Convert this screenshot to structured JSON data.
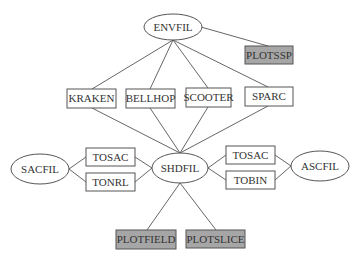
{
  "diagram": {
    "title": "",
    "colors": {
      "edge": "#555555",
      "box_fill": "#ffffff",
      "shaded_fill": "#a6a6a6",
      "text": "#333333"
    },
    "nodes": {
      "envfil": {
        "label": "ENVFIL",
        "shape": "ellipse"
      },
      "plotssp": {
        "label": "PLOTSSP",
        "shape": "shaded-box"
      },
      "kraken": {
        "label": "KRAKEN",
        "shape": "box"
      },
      "bellhop": {
        "label": "BELLHOP",
        "shape": "box"
      },
      "scooter": {
        "label": "SCOOTER",
        "shape": "box"
      },
      "sparc": {
        "label": "SPARC",
        "shape": "box"
      },
      "sacfil": {
        "label": "SACFIL",
        "shape": "ellipse"
      },
      "tosac_left": {
        "label": "TOSAC",
        "shape": "box"
      },
      "tonrl": {
        "label": "TONRL",
        "shape": "box"
      },
      "shdfil": {
        "label": "SHDFIL",
        "shape": "ellipse"
      },
      "tosac_right": {
        "label": "TOSAC",
        "shape": "box"
      },
      "tobin": {
        "label": "TOBIN",
        "shape": "box"
      },
      "ascfil": {
        "label": "ASCFIL",
        "shape": "ellipse"
      },
      "plotfield": {
        "label": "PLOTFIELD",
        "shape": "shaded-box"
      },
      "plotslice": {
        "label": "PLOTSLICE",
        "shape": "shaded-box"
      }
    },
    "edges": [
      [
        "ENVFIL",
        "PLOTSSP"
      ],
      [
        "ENVFIL",
        "KRAKEN"
      ],
      [
        "ENVFIL",
        "BELLHOP"
      ],
      [
        "ENVFIL",
        "SCOOTER"
      ],
      [
        "ENVFIL",
        "SPARC"
      ],
      [
        "KRAKEN",
        "SHDFIL"
      ],
      [
        "BELLHOP",
        "SHDFIL"
      ],
      [
        "SCOOTER",
        "SHDFIL"
      ],
      [
        "SPARC",
        "SHDFIL"
      ],
      [
        "SACFIL",
        "TOSAC"
      ],
      [
        "SACFIL",
        "TONRL"
      ],
      [
        "TOSAC",
        "SHDFIL"
      ],
      [
        "TONRL",
        "SHDFIL"
      ],
      [
        "SHDFIL",
        "TOSAC"
      ],
      [
        "SHDFIL",
        "TOBIN"
      ],
      [
        "TOSAC",
        "ASCFIL"
      ],
      [
        "TOBIN",
        "ASCFIL"
      ],
      [
        "SHDFIL",
        "PLOTFIELD"
      ],
      [
        "SHDFIL",
        "PLOTSLICE"
      ]
    ]
  }
}
